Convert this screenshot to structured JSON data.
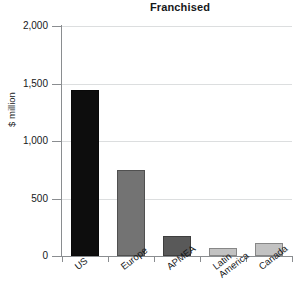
{
  "chart_data": {
    "type": "bar",
    "title": "Franchised",
    "xlabel": "",
    "ylabel": "$ million",
    "categories": [
      "US",
      "Europe",
      "APMEA",
      "Latin America",
      "Canada"
    ],
    "values": [
      1440,
      745,
      175,
      70,
      110
    ],
    "ylim": [
      0,
      2000
    ],
    "ytick_labels": [
      "0",
      "500",
      "1,000",
      "1,500",
      "2,000"
    ],
    "ytick_values": [
      0,
      500,
      1000,
      1500,
      2000
    ],
    "grid": true,
    "legend": "none",
    "bar_colors": [
      "#0d0d0d",
      "#737373",
      "#595959",
      "#c2c2c2",
      "#c2c2c2"
    ],
    "axis_color": "#8a8d90",
    "grid_color": "#dcdedf",
    "text_color": "#16181a",
    "category_lines": [
      [
        "US"
      ],
      [
        "Europe"
      ],
      [
        "APMEA"
      ],
      [
        "Latin",
        "America"
      ],
      [
        "Canada"
      ]
    ]
  }
}
